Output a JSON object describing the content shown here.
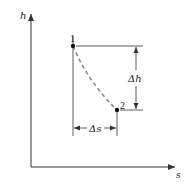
{
  "diagram": {
    "type": "h-s diagram (enthalpy-entropy)",
    "axes": {
      "y_label": "h",
      "x_label": "s"
    },
    "points": [
      {
        "label": "1",
        "x": 73,
        "y": 46
      },
      {
        "label": "2",
        "x": 117,
        "y": 110
      }
    ],
    "process_path": {
      "style": "dashed",
      "from": "1",
      "to": "2"
    },
    "dimensions": {
      "delta_h": "Δh",
      "delta_s": "Δs"
    },
    "colors": {
      "axis": "#333333",
      "path": "#8a8a8a",
      "text": "#222222"
    }
  }
}
